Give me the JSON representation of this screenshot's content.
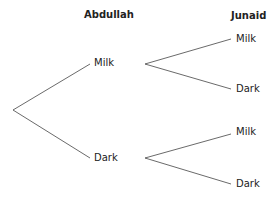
{
  "headers": {
    "first": "Abdullah",
    "second": "Junaid"
  },
  "first_level": [
    {
      "label": "Milk"
    },
    {
      "label": "Dark"
    }
  ],
  "second_level": [
    {
      "label": "Milk"
    },
    {
      "label": "Dark"
    },
    {
      "label": "Milk"
    },
    {
      "label": "Dark"
    }
  ],
  "colors": {
    "line": "#444444",
    "text": "#222222"
  }
}
